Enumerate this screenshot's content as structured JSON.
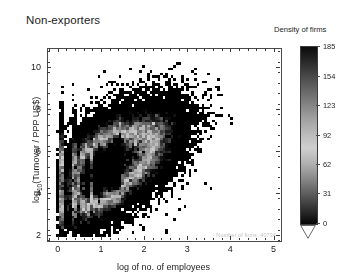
{
  "chart_data": {
    "type": "heatmap",
    "title": "Non-exporters",
    "xlabel": "log of no. of employees",
    "ylabel_html": "log<sub>10</sub>(Turnover / PPP US$)",
    "ylabel_text": "log10(Turnover / PPP US$)",
    "xlim": [
      -0.25,
      5.15
    ],
    "ylim": [
      1.75,
      10.9
    ],
    "xticks": [
      "0",
      "1",
      "2",
      "3",
      "4",
      "5"
    ],
    "xtick_values": [
      0,
      1,
      2,
      3,
      4,
      5
    ],
    "yticks": [
      "10",
      "8",
      "6",
      "4",
      "2"
    ],
    "ytick_values": [
      10,
      8,
      6,
      4,
      2
    ],
    "grid": false,
    "annotation": "Number of firms:  40734",
    "annotation_count": 40734,
    "colorbar": {
      "title": "Density of firms",
      "ticks": [
        "185",
        "154",
        "123",
        "92",
        "62",
        "31",
        "0"
      ],
      "tick_values": [
        185,
        154,
        123,
        92,
        62,
        31,
        0
      ],
      "vmin": 0,
      "vmax": 185,
      "orientation": "vertical",
      "position": "right",
      "colormap": "inverted-grayscale",
      "color_low": "#000000",
      "color_mid": "#d0d0d0",
      "color_high": "#000000"
    },
    "cloud": {
      "center_x": 1.45,
      "center_y": 5.6,
      "slope": 1.08,
      "intercept": 4.05,
      "scatter_y": 0.95,
      "x_spread": [
        0.0,
        4.7
      ],
      "y_spread": [
        2.0,
        10.0
      ]
    }
  },
  "colors": {
    "ink": "#1c1c1c",
    "frame": "#4a4a4a",
    "annotation": "#c2c2c2",
    "background": "#ffffff"
  }
}
